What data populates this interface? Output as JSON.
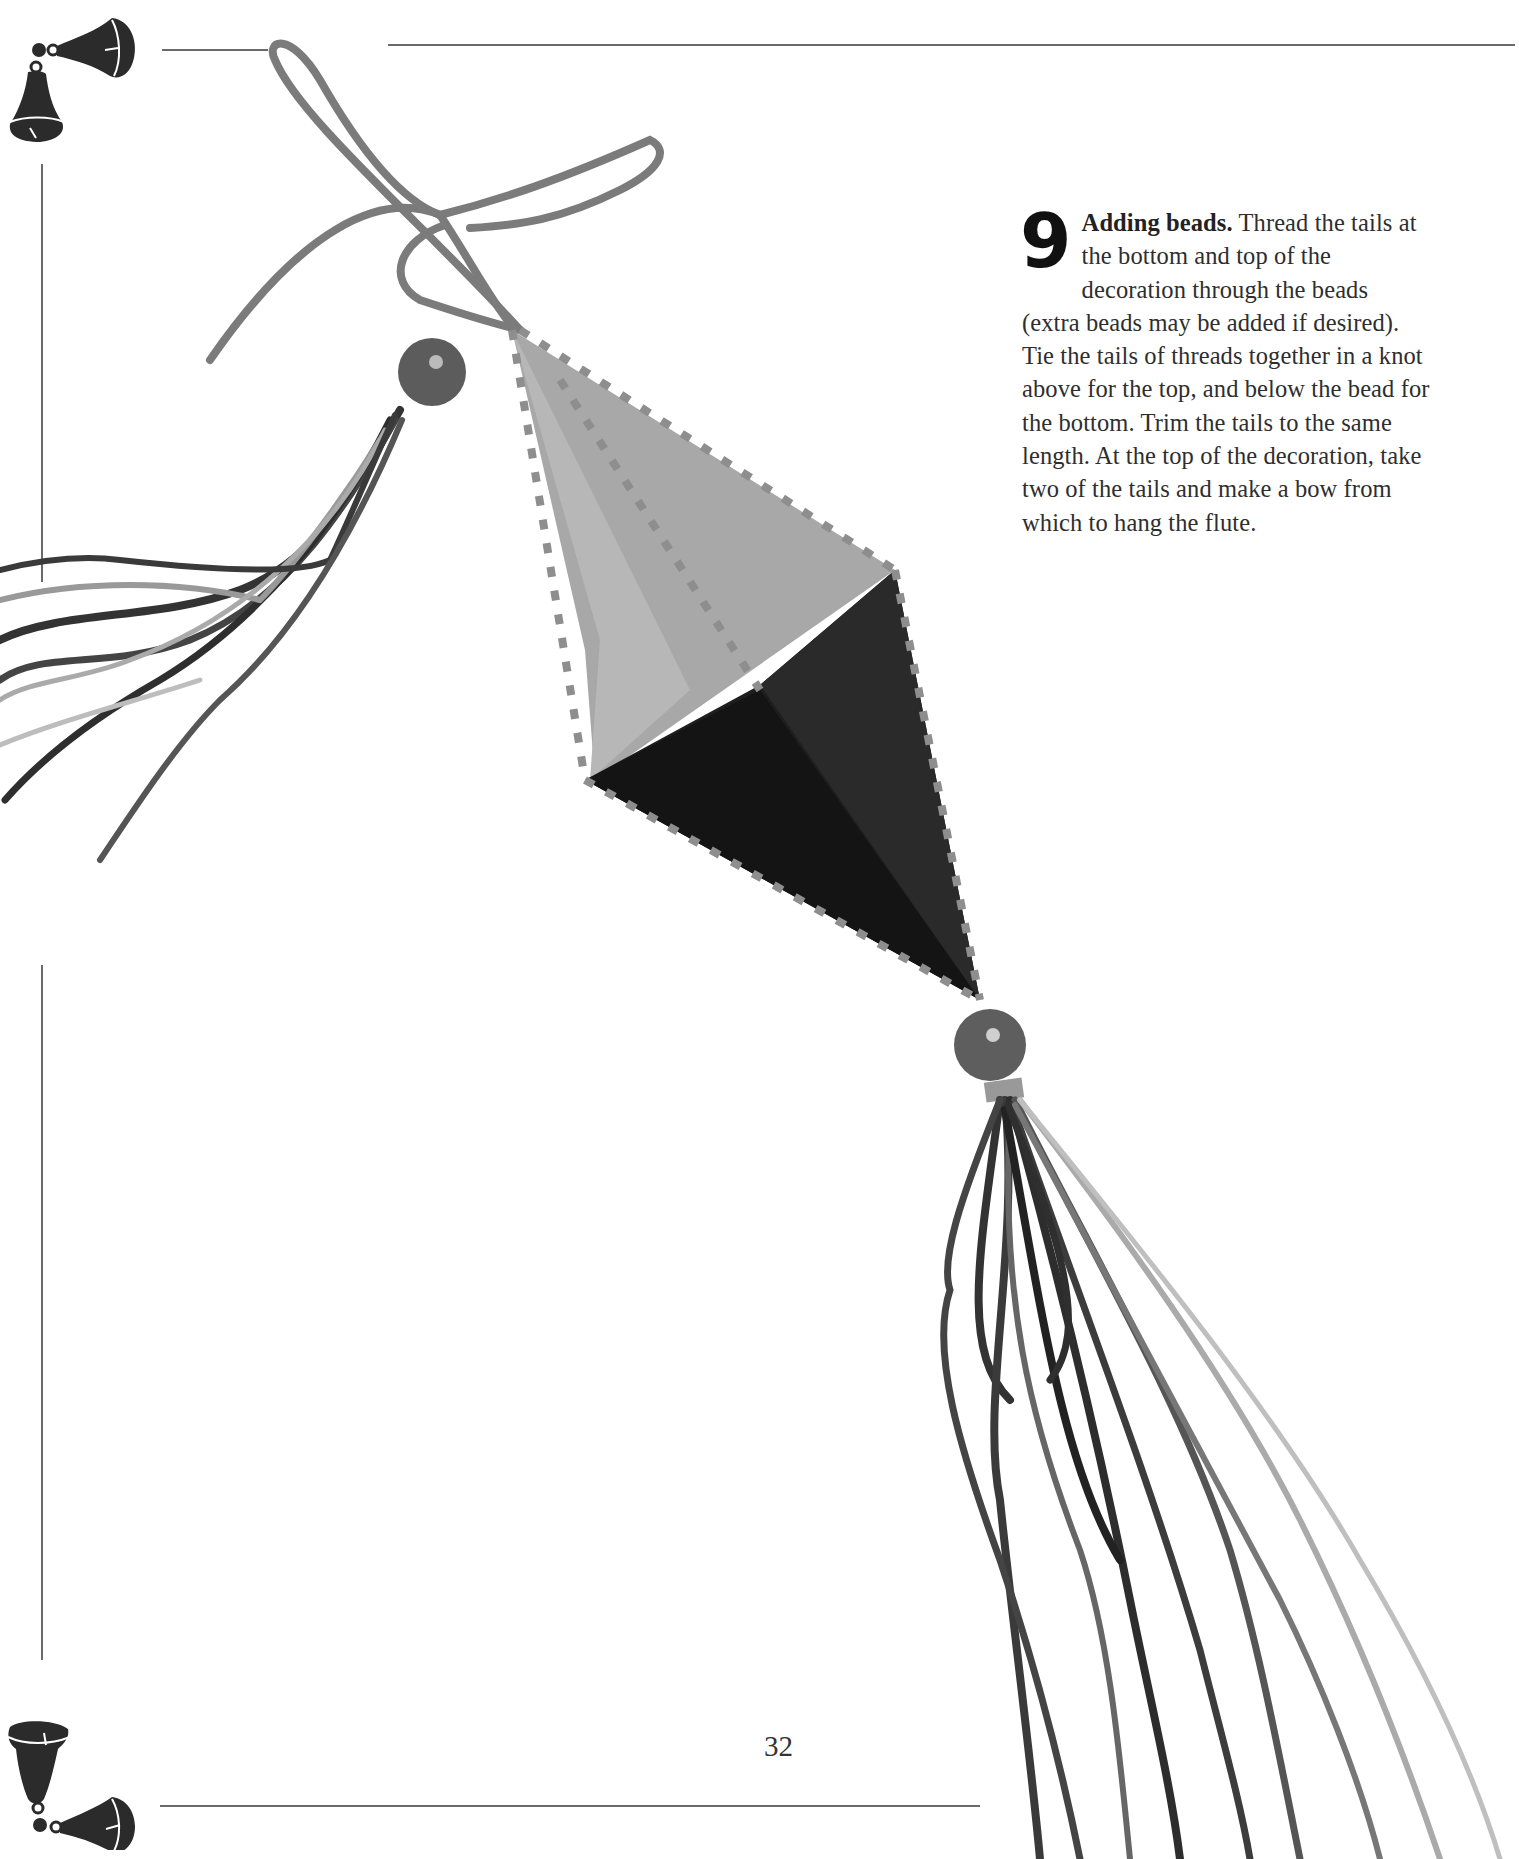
{
  "page": {
    "number": "32",
    "background": "#ffffff",
    "rule_color": "#6a6a6a"
  },
  "step": {
    "number": "9",
    "title": "Adding beads.",
    "body": " Thread the tails at the bottom and top of the decoration through the beads (extra beads may be added if desired). Tie the tails of threads together in a knot above for the top, and below the bead for the bottom. Trim the tails to the same length. At the top of the decoration, take two of the tails and make a bow from which to hang the flute."
  },
  "ornaments": {
    "top_left": "bell-pair-icon",
    "bottom_left": "bell-pair-icon"
  },
  "photo": {
    "subject": "stitched diamond-shaped flute ornament with beads, ribbon bow and metallic thread tassels",
    "colors": {
      "light_panel": "#a9a9a9",
      "dark_panel": "#1f1f1f",
      "ribbon": "#7a7a7a",
      "bead": "#5a5a5a"
    }
  }
}
